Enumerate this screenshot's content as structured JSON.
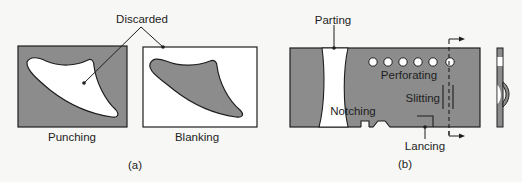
{
  "colors": {
    "background": "#f7f7f5",
    "metal": "#8c8c8c",
    "outline": "#1e1e1e",
    "hole": "#ffffff"
  },
  "panel_a": {
    "caption": "(a)",
    "callout": "Discarded",
    "left_label": "Punching",
    "right_label": "Blanking"
  },
  "panel_b": {
    "caption": "(b)",
    "labels": {
      "parting": "Parting",
      "perforating": "Perforating",
      "slitting": "Slitting",
      "notching": "Notching",
      "lancing": "Lancing"
    },
    "perforation_count": 6
  }
}
